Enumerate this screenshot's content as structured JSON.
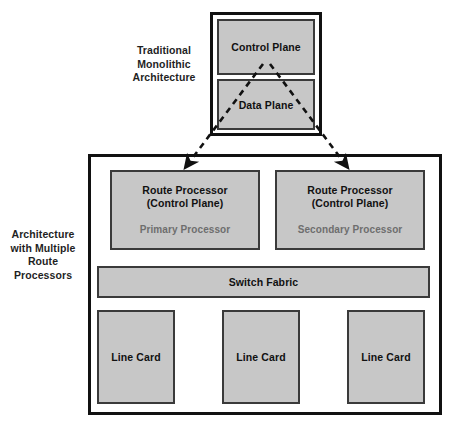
{
  "diagram": {
    "colors": {
      "box_fill": "#c7c7c7",
      "box_border": "#3a3a3a",
      "frame_border": "#111111",
      "text": "#111111",
      "subtext": "#6e6e6e",
      "background": "#ffffff"
    },
    "side_labels": {
      "traditional": "Traditional\nMonolithic\nArchitecture",
      "traditional_lines": [
        "Traditional",
        "Monolithic",
        "Architecture"
      ],
      "multi": "Architecture\nwith Multiple\nRoute\nProcessors",
      "multi_lines": [
        "Architecture",
        "with Multiple",
        "Route",
        "Processors"
      ]
    },
    "monolithic": {
      "control_plane": "Control Plane",
      "data_plane": "Data Plane"
    },
    "multiprocessor": {
      "route_processor_1": {
        "title_line_1": "Route Processor",
        "title_line_2": "(Control Plane)",
        "role": "Primary Processor"
      },
      "route_processor_2": {
        "title_line_1": "Route Processor",
        "title_line_2": "(Control Plane)",
        "role": "Secondary Processor"
      },
      "switch_fabric": "Switch Fabric",
      "line_cards": [
        "Line Card",
        "Line Card",
        "Line Card"
      ]
    },
    "connectors": [
      {
        "name": "monolithic-to-primary",
        "style": "dashed-arrow",
        "from": "Data Plane / Control Plane boundary",
        "to": "Route Processor (Primary)"
      },
      {
        "name": "monolithic-to-secondary",
        "style": "dashed-arrow",
        "from": "Data Plane / Control Plane boundary",
        "to": "Route Processor (Secondary)"
      }
    ]
  }
}
